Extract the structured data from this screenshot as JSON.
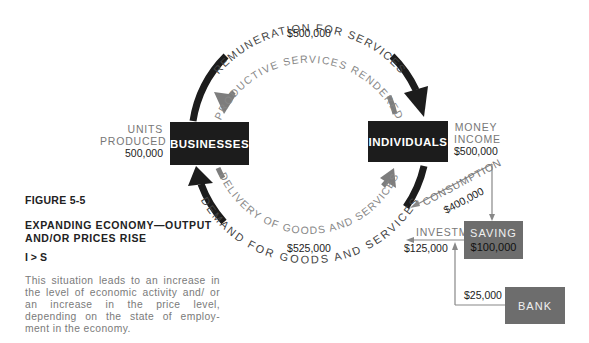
{
  "figure": {
    "number": "FIGURE 5-5",
    "title": "EXPANDING ECONOMY—OUTPUT AND/OR PRICES RISE",
    "equation": "I > S",
    "description": "This situation leads to an increase in the level of economic activity and/ or an increase in the price level, depending on the state of employ- ment in the economy."
  },
  "nodes": {
    "businesses": {
      "label": "BUSINESSES"
    },
    "individuals": {
      "label": "INDIVIDUALS"
    },
    "saving": {
      "label": "SAVING",
      "amount": "$100,000"
    },
    "bank": {
      "label": "BANK"
    }
  },
  "annotations": {
    "units_produced": {
      "line1": "UNITS",
      "line2": "PRODUCED",
      "value": "500,000"
    },
    "money_income": {
      "line1": "MONEY",
      "line2": "INCOME",
      "value": "$500,000"
    }
  },
  "flows": {
    "remuneration": {
      "label": "REMUNERATION FOR SERVICES",
      "amount": "$500,000"
    },
    "productive_services": {
      "label": "PRODUCTIVE SERVICES RENDERED"
    },
    "delivery": {
      "label": "DELIVERY OF GOODS AND SERVICES"
    },
    "demand": {
      "label": "DEMAND FOR GOODS AND SERVICES",
      "amount": "$525,000"
    },
    "consumption": {
      "label": "CONSUMPTION",
      "amount": "$400,000"
    },
    "investment": {
      "label": "INVESTMENT",
      "amount": "$125,000"
    },
    "bank_loan": {
      "amount": "$25,000"
    }
  },
  "colors": {
    "dark": "#1c1c1c",
    "grey_arrow": "#7d7d7d",
    "grey_box": "#6d6d6d",
    "label_grey": "#777777"
  }
}
